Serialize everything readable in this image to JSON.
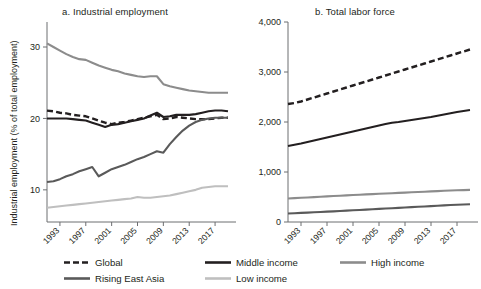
{
  "figure": {
    "background": "#ffffff",
    "text_color": "#231f20"
  },
  "panels": [
    {
      "id": "a",
      "title": "a. Industrial employment",
      "ylabel": "Industrial employment (% of total employment)",
      "yticks": [
        "10",
        "20",
        "30"
      ],
      "xticks": [
        "1993",
        "1997",
        "2001",
        "2005",
        "2009",
        "2013",
        "2017"
      ]
    },
    {
      "id": "b",
      "title": "b. Total labor force",
      "ylabel": "Total labor force (millions)",
      "yticks": [
        "0",
        "1,000",
        "2,000",
        "3,000",
        "4,000"
      ],
      "xticks": [
        "1993",
        "1997",
        "2001",
        "2005",
        "2009",
        "2013",
        "2017"
      ]
    }
  ],
  "legend": {
    "items": [
      {
        "key": "global",
        "label": "Global",
        "color": "#231f20",
        "style": "dashed"
      },
      {
        "key": "rising",
        "label": "Rising East Asia",
        "color": "#5a5a5a",
        "style": "solid"
      },
      {
        "key": "middle",
        "label": "Middle income",
        "color": "#231f20",
        "style": "solid"
      },
      {
        "key": "low",
        "label": "Low income",
        "color": "#bfbfbf",
        "style": "solid"
      },
      {
        "key": "high",
        "label": "High income",
        "color": "#8c8c8c",
        "style": "solid"
      }
    ]
  },
  "chart_data": [
    {
      "type": "line",
      "panel": "a",
      "title": "a. Industrial employment",
      "xlabel": "",
      "ylabel": "Industrial employment (% of total employment)",
      "x": [
        1991,
        1992,
        1993,
        1994,
        1995,
        1996,
        1997,
        1998,
        1999,
        2000,
        2001,
        2002,
        2003,
        2004,
        2005,
        2006,
        2007,
        2008,
        2009,
        2010,
        2011,
        2012,
        2013,
        2014,
        2015,
        2016,
        2017,
        2018,
        2019
      ],
      "xlim": [
        1991,
        2019
      ],
      "ylim": [
        5.5,
        33.5
      ],
      "yticks": [
        10,
        20,
        30
      ],
      "xticks": [
        1993,
        1997,
        2001,
        2005,
        2009,
        2013,
        2017
      ],
      "grid": false,
      "legend_position": "below-figure",
      "series": [
        {
          "name": "Global",
          "color": "#231f20",
          "style": "dashed",
          "values": [
            21.1,
            21.0,
            20.8,
            20.7,
            20.5,
            20.4,
            20.3,
            20.0,
            19.7,
            19.4,
            19.2,
            19.4,
            19.5,
            19.7,
            19.9,
            20.1,
            20.3,
            20.5,
            19.9,
            20.0,
            20.2,
            20.1,
            20.0,
            19.9,
            19.9,
            19.9,
            20.0,
            20.1,
            20.1
          ]
        },
        {
          "name": "Middle income",
          "color": "#231f20",
          "style": "solid",
          "values": [
            20.0,
            20.0,
            20.0,
            20.0,
            19.9,
            19.8,
            19.7,
            19.4,
            19.1,
            18.8,
            19.1,
            19.2,
            19.4,
            19.6,
            19.8,
            20.0,
            20.4,
            20.8,
            20.2,
            20.3,
            20.5,
            20.5,
            20.5,
            20.6,
            20.8,
            21.0,
            21.1,
            21.1,
            21.0
          ]
        },
        {
          "name": "Rising East Asia",
          "color": "#5a5a5a",
          "style": "solid",
          "values": [
            11.1,
            11.2,
            11.5,
            11.9,
            12.2,
            12.6,
            12.9,
            13.2,
            11.9,
            12.4,
            12.9,
            13.2,
            13.5,
            13.9,
            14.3,
            14.6,
            15.0,
            15.4,
            15.2,
            16.4,
            17.4,
            18.3,
            19.0,
            19.5,
            19.8,
            20.0,
            20.1,
            20.1,
            20.1
          ]
        },
        {
          "name": "High income",
          "color": "#8c8c8c",
          "style": "solid",
          "values": [
            30.5,
            30.0,
            29.5,
            29.0,
            28.6,
            28.3,
            28.2,
            27.8,
            27.4,
            27.1,
            26.8,
            26.6,
            26.3,
            26.1,
            25.9,
            25.8,
            25.9,
            25.9,
            24.8,
            24.5,
            24.3,
            24.1,
            23.9,
            23.8,
            23.7,
            23.6,
            23.6,
            23.6,
            23.6
          ]
        },
        {
          "name": "Low income",
          "color": "#bfbfbf",
          "style": "solid",
          "values": [
            7.5,
            7.6,
            7.7,
            7.8,
            7.9,
            8.0,
            8.1,
            8.2,
            8.3,
            8.4,
            8.5,
            8.6,
            8.7,
            8.8,
            9.0,
            8.9,
            8.9,
            9.0,
            9.1,
            9.2,
            9.4,
            9.6,
            9.8,
            10.0,
            10.3,
            10.4,
            10.5,
            10.5,
            10.5
          ]
        }
      ]
    },
    {
      "type": "line",
      "panel": "b",
      "title": "b. Total labor force",
      "xlabel": "",
      "ylabel": "Total labor force (millions)",
      "x": [
        1991,
        1992,
        1993,
        1994,
        1995,
        1996,
        1997,
        1998,
        1999,
        2000,
        2001,
        2002,
        2003,
        2004,
        2005,
        2006,
        2007,
        2008,
        2009,
        2010,
        2011,
        2012,
        2013,
        2014,
        2015,
        2016,
        2017,
        2018,
        2019
      ],
      "xlim": [
        1991,
        2019
      ],
      "ylim": [
        0,
        4000
      ],
      "yticks": [
        0,
        1000,
        2000,
        3000,
        4000
      ],
      "xticks": [
        1993,
        1997,
        2001,
        2005,
        2009,
        2013,
        2017
      ],
      "grid": false,
      "legend_position": "below-figure",
      "series": [
        {
          "name": "Global",
          "color": "#231f20",
          "style": "dashed",
          "values": [
            2360,
            2380,
            2410,
            2450,
            2490,
            2530,
            2570,
            2610,
            2650,
            2690,
            2730,
            2770,
            2810,
            2850,
            2890,
            2930,
            2970,
            3010,
            3050,
            3090,
            3130,
            3170,
            3210,
            3250,
            3290,
            3330,
            3370,
            3410,
            3450
          ]
        },
        {
          "name": "Middle income",
          "color": "#231f20",
          "style": "solid",
          "values": [
            1520,
            1545,
            1570,
            1600,
            1630,
            1660,
            1690,
            1720,
            1750,
            1780,
            1810,
            1840,
            1870,
            1900,
            1930,
            1960,
            1985,
            2000,
            2020,
            2040,
            2060,
            2080,
            2100,
            2125,
            2150,
            2175,
            2200,
            2220,
            2240
          ]
        },
        {
          "name": "High income",
          "color": "#8c8c8c",
          "style": "solid",
          "values": [
            470,
            477,
            484,
            491,
            498,
            505,
            512,
            519,
            526,
            533,
            540,
            546,
            552,
            558,
            564,
            570,
            576,
            582,
            588,
            594,
            600,
            606,
            612,
            618,
            624,
            630,
            634,
            638,
            642
          ]
        },
        {
          "name": "Low income",
          "color": "#5a5a5a",
          "style": "solid",
          "values": [
            170,
            176,
            182,
            188,
            194,
            200,
            207,
            213,
            220,
            227,
            234,
            241,
            248,
            255,
            262,
            269,
            276,
            283,
            290,
            297,
            304,
            311,
            318,
            325,
            332,
            339,
            345,
            350,
            355
          ]
        }
      ]
    }
  ]
}
